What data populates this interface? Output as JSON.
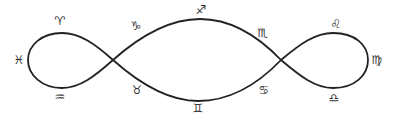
{
  "diagram": {
    "type": "zodiac-lemniscate",
    "stroke_color": "#222222",
    "background": "#ffffff",
    "crossings": [
      {
        "x": 113,
        "y": 60
      },
      {
        "x": 281,
        "y": 60
      }
    ],
    "signs": [
      {
        "name": "pisces",
        "glyph": "♓",
        "x": 19,
        "y": 60
      },
      {
        "name": "aries",
        "glyph": "♈",
        "x": 60,
        "y": 21
      },
      {
        "name": "aquarius",
        "glyph": "♒",
        "x": 60,
        "y": 97
      },
      {
        "name": "capricorn",
        "glyph": "♑",
        "x": 136,
        "y": 26
      },
      {
        "name": "taurus",
        "glyph": "♉",
        "x": 137,
        "y": 90
      },
      {
        "name": "sagittarius",
        "glyph": "♐",
        "x": 201,
        "y": 10
      },
      {
        "name": "gemini",
        "glyph": "♊",
        "x": 198,
        "y": 108
      },
      {
        "name": "scorpio",
        "glyph": "♏",
        "x": 263,
        "y": 33
      },
      {
        "name": "cancer",
        "glyph": "♋",
        "x": 264,
        "y": 90
      },
      {
        "name": "leo",
        "glyph": "♌",
        "x": 336,
        "y": 24
      },
      {
        "name": "virgo",
        "glyph": "♍",
        "x": 377,
        "y": 60
      },
      {
        "name": "libra",
        "glyph": "♎",
        "x": 334,
        "y": 98
      }
    ]
  }
}
